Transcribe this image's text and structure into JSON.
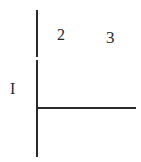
{
  "diagram": {
    "labels": {
      "row_label": "I",
      "col_label_1": "2",
      "col_label_2": "3"
    },
    "colors": {
      "line": "#2a2a2a",
      "text": "#2a2a2a",
      "background": "#ffffff"
    }
  }
}
